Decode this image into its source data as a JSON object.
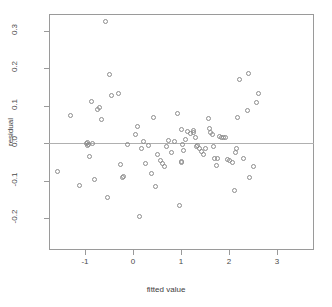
{
  "chart_data": {
    "type": "scatter",
    "title": "",
    "xlabel": "fitted value",
    "ylabel": "residual",
    "xlim": [
      -1.75,
      3.77
    ],
    "ylim": [
      -0.285,
      0.345
    ],
    "grid": false,
    "legend": null,
    "reference_lines": [
      {
        "orientation": "horizontal",
        "value": 0.0,
        "color": "#b0b0b0"
      }
    ],
    "xticks": [
      -1,
      0,
      1,
      2,
      3
    ],
    "xticklabels": [
      "-1",
      "0",
      "1",
      "2",
      "3"
    ],
    "yticks": [
      -0.2,
      -0.1,
      0.0,
      0.1,
      0.2,
      0.3
    ],
    "yticklabels": [
      "-0.2",
      "-0.1",
      "0.0",
      "0.1",
      "0.2",
      "0.3"
    ],
    "marker": "open-circle",
    "marker_color": "#8d8d8d",
    "n_points": 100,
    "x": [
      -1.58,
      -1.3,
      -1.12,
      -0.95,
      -0.95,
      -0.94,
      -0.92,
      -0.9,
      -0.88,
      -0.86,
      -0.82,
      -0.8,
      -0.74,
      -0.7,
      -0.64,
      -0.58,
      -0.54,
      -0.5,
      -0.48,
      -0.46,
      -0.44,
      -0.41,
      -0.38,
      -0.3,
      -0.26,
      -0.22,
      -0.12,
      0.06,
      0.1,
      0.13,
      0.18,
      0.2,
      0.22,
      0.24,
      0.27,
      0.33,
      0.38,
      0.42,
      0.46,
      0.52,
      0.58,
      0.61,
      0.63,
      0.66,
      0.7,
      0.74,
      0.78,
      0.8,
      0.86,
      0.92,
      0.97,
      1.0,
      1.01,
      1.02,
      1.04,
      1.06,
      1.1,
      1.14,
      1.2,
      1.25,
      1.27,
      1.3,
      1.33,
      1.35,
      1.36,
      1.38,
      1.42,
      1.46,
      1.52,
      1.57,
      1.6,
      1.62,
      1.65,
      1.68,
      1.7,
      1.74,
      1.76,
      1.78,
      1.8,
      1.84,
      1.88,
      1.92,
      1.97,
      2.02,
      2.08,
      2.12,
      2.14,
      2.16,
      2.18,
      2.22,
      2.3,
      2.38,
      2.4,
      2.42,
      2.52,
      2.58,
      2.62,
      2.7,
      2.74,
      2.78,
      3.02,
      3.1,
      3.18,
      3.22,
      3.3,
      3.44,
      3.5,
      3.56
    ],
    "y": [
      -0.075,
      0.073,
      -0.113,
      0.0,
      -0.008,
      -0.005,
      -0.035,
      -0.003,
      -0.002,
      0.112,
      0.0,
      -0.096,
      0.091,
      0.096,
      0.063,
      0.325,
      -0.146,
      0.184,
      0.127,
      0.134,
      -0.058,
      -0.091,
      -0.089,
      -0.003,
      0.023,
      0.046,
      -0.196,
      -0.013,
      0.005,
      -0.055,
      -0.007,
      -0.08,
      0.07,
      -0.115,
      -0.03,
      -0.045,
      -0.053,
      -0.062,
      -0.01,
      0.008,
      -0.025,
      0.005,
      0.079,
      -0.165,
      0.037,
      -0.048,
      -0.052,
      -0.003,
      -0.02,
      0.01,
      0.032,
      0.027,
      0.035,
      0.03,
      0.016,
      -0.009,
      -0.007,
      -0.013,
      -0.022,
      -0.03,
      -0.013,
      0.065,
      0.04,
      0.03,
      0.022,
      -0.008,
      -0.04,
      -0.06,
      -0.042,
      0.018,
      0.015,
      0.016,
      0.014,
      -0.043,
      -0.045,
      -0.052,
      -0.127,
      -0.026,
      -0.015,
      0.07,
      0.17,
      -0.04,
      0.088,
      0.186,
      -0.092,
      -0.062,
      0.11,
      0.134
    ],
    "points": [
      {
        "x": -1.58,
        "y": -0.075
      },
      {
        "x": -1.3,
        "y": 0.073
      },
      {
        "x": -1.12,
        "y": -0.113
      },
      {
        "x": -0.97,
        "y": 0.0
      },
      {
        "x": -0.95,
        "y": -0.007
      },
      {
        "x": -0.94,
        "y": 0.003
      },
      {
        "x": -0.93,
        "y": -0.004
      },
      {
        "x": -0.9,
        "y": -0.035
      },
      {
        "x": -0.86,
        "y": 0.112
      },
      {
        "x": -0.84,
        "y": 0.0
      },
      {
        "x": -0.8,
        "y": -0.096
      },
      {
        "x": -0.74,
        "y": 0.091
      },
      {
        "x": -0.7,
        "y": 0.096
      },
      {
        "x": -0.66,
        "y": 0.063
      },
      {
        "x": -0.58,
        "y": 0.325
      },
      {
        "x": -0.54,
        "y": -0.146
      },
      {
        "x": -0.5,
        "y": 0.184
      },
      {
        "x": -0.44,
        "y": 0.127
      },
      {
        "x": -0.3,
        "y": 0.134
      },
      {
        "x": -0.26,
        "y": -0.058
      },
      {
        "x": -0.22,
        "y": -0.091
      },
      {
        "x": -0.2,
        "y": -0.089
      },
      {
        "x": -0.12,
        "y": -0.003
      },
      {
        "x": 0.06,
        "y": 0.023
      },
      {
        "x": 0.1,
        "y": 0.046
      },
      {
        "x": 0.13,
        "y": -0.196
      },
      {
        "x": 0.18,
        "y": -0.013
      },
      {
        "x": 0.22,
        "y": 0.005
      },
      {
        "x": 0.27,
        "y": -0.055
      },
      {
        "x": 0.33,
        "y": -0.007
      },
      {
        "x": 0.38,
        "y": -0.08
      },
      {
        "x": 0.42,
        "y": 0.07
      },
      {
        "x": 0.46,
        "y": -0.115
      },
      {
        "x": 0.52,
        "y": -0.03
      },
      {
        "x": 0.58,
        "y": -0.045
      },
      {
        "x": 0.61,
        "y": -0.053
      },
      {
        "x": 0.66,
        "y": -0.062
      },
      {
        "x": 0.7,
        "y": -0.01
      },
      {
        "x": 0.74,
        "y": 0.008
      },
      {
        "x": 0.8,
        "y": -0.025
      },
      {
        "x": 0.86,
        "y": 0.005
      },
      {
        "x": 0.92,
        "y": 0.079
      },
      {
        "x": 0.97,
        "y": -0.165
      },
      {
        "x": 1.0,
        "y": 0.037
      },
      {
        "x": 1.01,
        "y": -0.048
      },
      {
        "x": 1.02,
        "y": -0.052
      },
      {
        "x": 1.04,
        "y": -0.003
      },
      {
        "x": 1.06,
        "y": -0.02
      },
      {
        "x": 1.1,
        "y": 0.01
      },
      {
        "x": 1.14,
        "y": 0.032
      },
      {
        "x": 1.2,
        "y": 0.027
      },
      {
        "x": 1.25,
        "y": 0.035
      },
      {
        "x": 1.27,
        "y": 0.03
      },
      {
        "x": 1.3,
        "y": 0.016
      },
      {
        "x": 1.33,
        "y": -0.009
      },
      {
        "x": 1.35,
        "y": -0.007
      },
      {
        "x": 1.38,
        "y": -0.013
      },
      {
        "x": 1.42,
        "y": -0.022
      },
      {
        "x": 1.46,
        "y": -0.03
      },
      {
        "x": 1.52,
        "y": -0.013
      },
      {
        "x": 1.57,
        "y": 0.065
      },
      {
        "x": 1.6,
        "y": 0.04
      },
      {
        "x": 1.62,
        "y": 0.03
      },
      {
        "x": 1.65,
        "y": 0.022
      },
      {
        "x": 1.68,
        "y": -0.008
      },
      {
        "x": 1.7,
        "y": -0.04
      },
      {
        "x": 1.74,
        "y": -0.06
      },
      {
        "x": 1.76,
        "y": -0.042
      },
      {
        "x": 1.8,
        "y": 0.018
      },
      {
        "x": 1.84,
        "y": 0.015
      },
      {
        "x": 1.88,
        "y": 0.016
      },
      {
        "x": 1.92,
        "y": 0.014
      },
      {
        "x": 1.97,
        "y": -0.043
      },
      {
        "x": 2.02,
        "y": -0.045
      },
      {
        "x": 2.08,
        "y": -0.052
      },
      {
        "x": 2.12,
        "y": -0.127
      },
      {
        "x": 2.14,
        "y": -0.026
      },
      {
        "x": 2.16,
        "y": -0.015
      },
      {
        "x": 2.18,
        "y": 0.07
      },
      {
        "x": 2.22,
        "y": 0.17
      },
      {
        "x": 2.3,
        "y": -0.04
      },
      {
        "x": 2.38,
        "y": 0.088
      },
      {
        "x": 2.4,
        "y": 0.186
      },
      {
        "x": 2.42,
        "y": -0.092
      },
      {
        "x": 2.52,
        "y": -0.062
      },
      {
        "x": 2.58,
        "y": 0.11
      },
      {
        "x": 2.62,
        "y": 0.134
      }
    ]
  },
  "axes": {
    "xlabel": "fitted value",
    "ylabel": "residual",
    "xticklabels": [
      "-1",
      "0",
      "1",
      "2",
      "3"
    ],
    "yticklabels": [
      "0.3",
      "0.2",
      "0.1",
      "0.0",
      "-0.1",
      "-0.2"
    ]
  },
  "title": ""
}
